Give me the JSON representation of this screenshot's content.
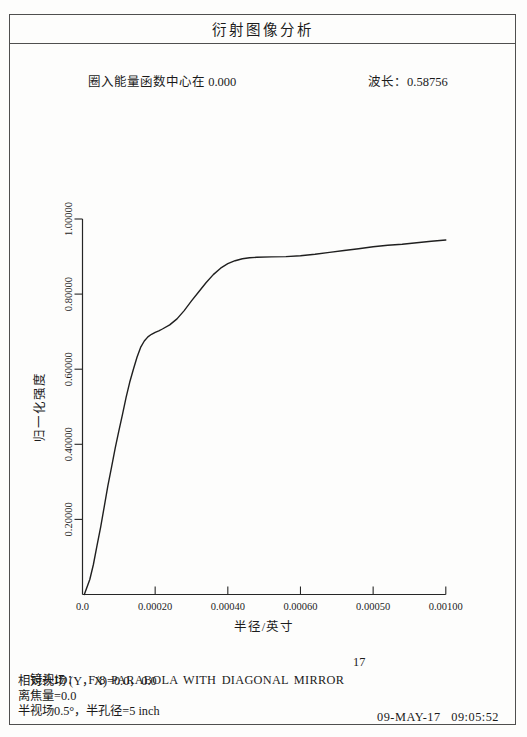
{
  "page": {
    "title": "衍射图像分析",
    "header": {
      "encircled_energy_center": "圈入能量函数中心在 0.000",
      "wavelength": "波长：0.58756"
    },
    "footer": {
      "lens_id_label": "镜头ID：",
      "lens_id_value": "F/8 PARABOLA WITH DIAGONAL MIRROR",
      "page_number": "17",
      "relative_field": "相对视场 (Y，X)=0.0，0.0",
      "defocus": "离焦量=0.0",
      "half_field": "半视场0.5°，半孔径=5 inch",
      "timestamp": "09-MAY-17   09:05:52"
    }
  },
  "chart_data": {
    "type": "line",
    "title": "",
    "xlabel": "半径/英寸",
    "ylabel": "归一化强度",
    "xlim": [
      0,
      0.001
    ],
    "ylim": [
      0,
      1.0
    ],
    "grid": false,
    "legend": "none",
    "line_color": "#1f1f1f",
    "xticks": [
      {
        "value": 0,
        "label": "0.0"
      },
      {
        "value": 0.0002,
        "label": "0.00020"
      },
      {
        "value": 0.0004,
        "label": "0.00040"
      },
      {
        "value": 0.0006,
        "label": "0.00060"
      },
      {
        "value": 0.0008,
        "label": "0.00050"
      },
      {
        "value": 0.001,
        "label": "0.00100"
      }
    ],
    "yticks": [
      {
        "value": 0.2,
        "label": "0.20000"
      },
      {
        "value": 0.4,
        "label": "0.40000"
      },
      {
        "value": 0.6,
        "label": "0.60000"
      },
      {
        "value": 0.8,
        "label": "0.80000"
      },
      {
        "value": 1.0,
        "label": "1.00000"
      }
    ],
    "series": [
      {
        "name": "encircled-energy",
        "points": [
          [
            5e-06,
            0.0
          ],
          [
            2e-05,
            0.04
          ],
          [
            3e-05,
            0.08
          ],
          [
            4e-05,
            0.13
          ],
          [
            5e-05,
            0.18
          ],
          [
            6e-05,
            0.235
          ],
          [
            7e-05,
            0.29
          ],
          [
            8e-05,
            0.34
          ],
          [
            9e-05,
            0.39
          ],
          [
            0.0001,
            0.435
          ],
          [
            0.00011,
            0.48
          ],
          [
            0.00012,
            0.525
          ],
          [
            0.00013,
            0.565
          ],
          [
            0.00014,
            0.6
          ],
          [
            0.00015,
            0.632
          ],
          [
            0.00016,
            0.658
          ],
          [
            0.00017,
            0.675
          ],
          [
            0.00018,
            0.686
          ],
          [
            0.00019,
            0.693
          ],
          [
            0.0002,
            0.698
          ],
          [
            0.00021,
            0.702
          ],
          [
            0.00022,
            0.707
          ],
          [
            0.00024,
            0.718
          ],
          [
            0.00026,
            0.734
          ],
          [
            0.00028,
            0.756
          ],
          [
            0.0003,
            0.782
          ],
          [
            0.00032,
            0.806
          ],
          [
            0.00034,
            0.83
          ],
          [
            0.00036,
            0.852
          ],
          [
            0.00038,
            0.869
          ],
          [
            0.0004,
            0.881
          ],
          [
            0.00042,
            0.889
          ],
          [
            0.00044,
            0.894
          ],
          [
            0.00046,
            0.897
          ],
          [
            0.00048,
            0.898
          ],
          [
            0.00052,
            0.899
          ],
          [
            0.00056,
            0.9
          ],
          [
            0.0006,
            0.902
          ],
          [
            0.00064,
            0.906
          ],
          [
            0.00068,
            0.911
          ],
          [
            0.00072,
            0.916
          ],
          [
            0.00076,
            0.921
          ],
          [
            0.0008,
            0.926
          ],
          [
            0.00084,
            0.93
          ],
          [
            0.00088,
            0.933
          ],
          [
            0.00092,
            0.937
          ],
          [
            0.00096,
            0.941
          ],
          [
            0.001,
            0.944
          ]
        ]
      }
    ]
  }
}
